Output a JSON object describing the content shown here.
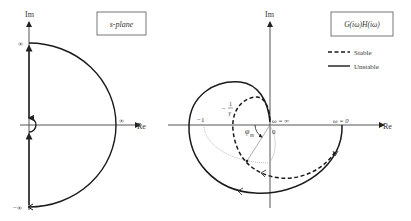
{
  "left_panel": {
    "title": "s-plane",
    "axis_im_label": "Im",
    "axis_re_label": "Re",
    "inf_top_label": "∞",
    "inf_bottom_label": "−∞",
    "inf_right_label": "∞"
  },
  "right_panel": {
    "title": "G(iω)H(iω)",
    "axis_im_label": "Im",
    "axis_re_label": "Re",
    "minus_one_label": "−1",
    "minus_inv_gamma_num": "1",
    "minus_inv_gamma_den": "γ",
    "minus_sign": "−",
    "phase_margin_label": "φ",
    "phase_margin_sub": "m",
    "omega_inf_label": "ω = ∞",
    "omega_zero_label": "ω = 0",
    "origin_label": "0",
    "legend": [
      {
        "label": "Stable",
        "style": "dashed"
      },
      {
        "label": "Unstable",
        "style": "solid"
      }
    ]
  },
  "colors": {
    "curve": "#1a1a1a",
    "axis": "#555555",
    "unit_circle": "#999999"
  }
}
